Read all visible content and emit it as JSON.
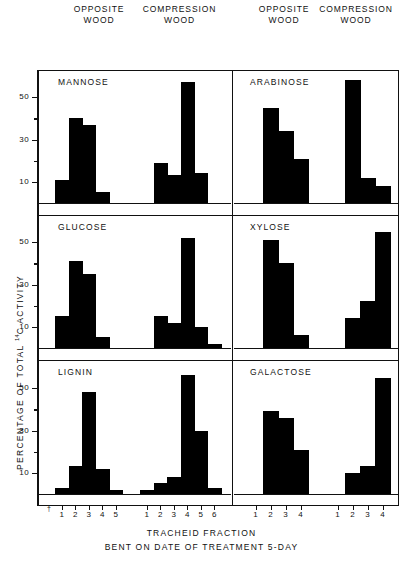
{
  "headers": [
    {
      "line1": "OPPOSITE",
      "line2": "WOOD"
    },
    {
      "line1": "COMPRESSION",
      "line2": "WOOD"
    },
    {
      "line1": "OPPOSITE",
      "line2": "WOOD"
    },
    {
      "line1": "COMPRESSION",
      "line2": "WOOD"
    }
  ],
  "axis": {
    "ylabel_main": "PERCENTAGE OF TOTAL",
    "ylabel_sup": "14",
    "ylabel_tail": "C ACTIVITY",
    "yticks": [
      10,
      30,
      50
    ],
    "ylim": [
      0,
      60
    ],
    "caption_line1": "TRACHEID  FRACTION",
    "caption_line2": "BENT ON DATE OF TREATMENT 5-DAY",
    "dagger": "†"
  },
  "chart_data": {
    "type": "bar",
    "xlabel": "TRACHEID FRACTION",
    "ylabel": "PERCENTAGE OF TOTAL 14C ACTIVITY",
    "ylim": [
      0,
      60
    ],
    "yticks": [
      10,
      30,
      50
    ],
    "grid": false,
    "legend": "none",
    "panels": [
      {
        "name": "MANNOSE",
        "row": 0,
        "column_groups": [
          {
            "wood": "OPPOSITE WOOD",
            "categories": [
              "1",
              "2",
              "3",
              "4",
              "5"
            ],
            "values": [
              11,
              40,
              37,
              5,
              0
            ]
          },
          {
            "wood": "COMPRESSION WOOD",
            "categories": [
              "1",
              "2",
              "3",
              "4",
              "5",
              "6"
            ],
            "values": [
              0,
              19,
              13,
              57,
              14,
              0
            ]
          }
        ]
      },
      {
        "name": "ARABINOSE",
        "row": 0,
        "column_groups": [
          {
            "wood": "OPPOSITE WOOD",
            "categories": [
              "1",
              "2",
              "3",
              "4"
            ],
            "values": [
              0,
              45,
              34,
              21
            ]
          },
          {
            "wood": "COMPRESSION WOOD",
            "categories": [
              "1",
              "2",
              "3",
              "4"
            ],
            "values": [
              0,
              58,
              12,
              8
            ]
          }
        ]
      },
      {
        "name": "GLUCOSE",
        "row": 1,
        "column_groups": [
          {
            "wood": "OPPOSITE WOOD",
            "categories": [
              "1",
              "2",
              "3",
              "4",
              "5"
            ],
            "values": [
              15,
              41,
              35,
              5,
              0
            ]
          },
          {
            "wood": "COMPRESSION WOOD",
            "categories": [
              "1",
              "2",
              "3",
              "4",
              "5",
              "6"
            ],
            "values": [
              0,
              15,
              12,
              52,
              10,
              2
            ]
          }
        ]
      },
      {
        "name": "XYLOSE",
        "row": 1,
        "column_groups": [
          {
            "wood": "OPPOSITE WOOD",
            "categories": [
              "1",
              "2",
              "3",
              "4"
            ],
            "values": [
              0,
              51,
              40,
              6
            ]
          },
          {
            "wood": "COMPRESSION WOOD",
            "categories": [
              "1",
              "2",
              "3",
              "4"
            ],
            "values": [
              0,
              14,
              22,
              55
            ]
          }
        ]
      },
      {
        "name": "LIGNIN",
        "row": 2,
        "column_groups": [
          {
            "wood": "OPPOSITE WOOD",
            "categories": [
              "1",
              "2",
              "3",
              "4",
              "5"
            ],
            "values": [
              3,
              13,
              48,
              12,
              2
            ]
          },
          {
            "wood": "COMPRESSION WOOD",
            "categories": [
              "1",
              "2",
              "3",
              "4",
              "5",
              "6"
            ],
            "values": [
              2,
              5,
              8,
              56,
              30,
              3
            ]
          }
        ]
      },
      {
        "name": "GALACTOSE",
        "row": 2,
        "column_groups": [
          {
            "wood": "OPPOSITE WOOD",
            "categories": [
              "1",
              "2",
              "3",
              "4"
            ],
            "values": [
              0,
              39,
              36,
              21
            ]
          },
          {
            "wood": "COMPRESSION WOOD",
            "categories": [
              "1",
              "2",
              "3",
              "4"
            ],
            "values": [
              0,
              10,
              13,
              55
            ]
          }
        ]
      }
    ]
  }
}
